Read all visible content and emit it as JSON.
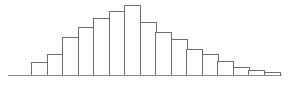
{
  "figure": {
    "title": "",
    "background_color": "#ffffff",
    "bar_fill_color": "#ffffff",
    "bar_stroke_color": "#6e6e6e",
    "axis_color": "#8a8a8a",
    "width_px": 289,
    "height_px": 90
  },
  "chart_data": {
    "type": "bar",
    "title": "",
    "subtitle": "",
    "xlabel": "",
    "ylabel": "",
    "legend": [],
    "legend_position": "none",
    "grid": false,
    "orientation": "vertical",
    "categories": [
      "1",
      "2",
      "3",
      "4",
      "5",
      "6",
      "7",
      "8",
      "9",
      "10",
      "11",
      "12",
      "13",
      "14",
      "15",
      "16"
    ],
    "values": [
      13,
      21,
      38,
      48,
      57,
      64,
      70,
      53,
      43,
      36,
      26,
      21,
      14,
      8,
      5,
      3
    ],
    "ylim": [
      0,
      70
    ],
    "xlim": [
      0,
      16
    ],
    "bar_count": 16,
    "peak_category": "7",
    "peak_value": 70,
    "baseline": {
      "x_start_px": 8,
      "x_end_px": 282,
      "y_px": 75
    },
    "bar_geometry": {
      "first_bar_left_px": 31,
      "bar_width_px": 15.5,
      "baseline_y_px": 75,
      "max_bar_height_px": 70
    }
  }
}
